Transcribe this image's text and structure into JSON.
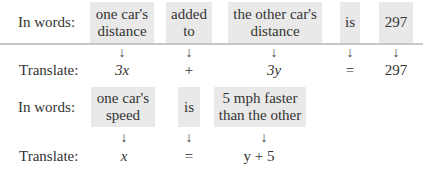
{
  "equation1": {
    "row_label_words": "In words:",
    "row_label_translate": "Translate:",
    "phrases": [
      {
        "text_line1": "one car's",
        "text_line2": "distance",
        "translation": "3x"
      },
      {
        "text_line1": "added",
        "text_line2": "to",
        "translation": "+"
      },
      {
        "text_line1": "the other car's",
        "text_line2": "distance",
        "translation": "3y"
      },
      {
        "text_line1": "is",
        "text_line2": "",
        "translation": "="
      },
      {
        "text_line1": "297",
        "text_line2": "",
        "translation": "297"
      }
    ]
  },
  "equation2": {
    "row_label_words": "In words:",
    "row_label_translate": "Translate:",
    "phrases": [
      {
        "text_line1": "one car's",
        "text_line2": "speed",
        "translation": "x"
      },
      {
        "text_line1": "is",
        "text_line2": "",
        "translation": "="
      },
      {
        "text_line1": "5 mph faster",
        "text_line2": "than the other",
        "translation": "y + 5"
      }
    ]
  },
  "icons": {
    "arrow": "down-arrow-icon",
    "arrow_glyph": "↓"
  },
  "colors": {
    "box_background": "#e9e9e9",
    "divider": "#c8c8c8"
  }
}
